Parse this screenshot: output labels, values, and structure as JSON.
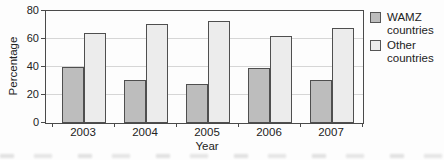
{
  "chart_data": {
    "type": "bar",
    "categories": [
      "2003",
      "2004",
      "2005",
      "2006",
      "2007"
    ],
    "series": [
      {
        "name": "WAMZ countries",
        "values": [
          40,
          31,
          28,
          39,
          31
        ],
        "color": "#bdbdbd"
      },
      {
        "name": "Other countries",
        "values": [
          64,
          71,
          73,
          62,
          68
        ],
        "color": "#ececec"
      }
    ],
    "title": "",
    "xlabel": "Year",
    "ylabel": "Percentage",
    "ylim": [
      0,
      80
    ],
    "yticks": [
      0,
      20,
      40,
      60,
      80
    ],
    "grid": true,
    "legend_position": "right",
    "frame": true,
    "colors": {
      "axis": "#4a4a4a",
      "gridline": "#d6d6d6",
      "text": "#222222",
      "background": "#fdfdfd"
    }
  }
}
